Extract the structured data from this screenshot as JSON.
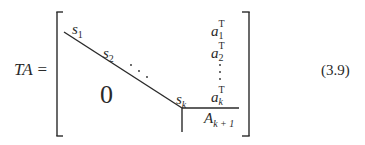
{
  "equation": {
    "lhs": {
      "text": "TA",
      "operator": "="
    },
    "number": "(3.9)",
    "matrix": {
      "diagonal": [
        {
          "base": "s",
          "sub": "1"
        },
        {
          "base": "s",
          "sub": "2"
        },
        {
          "ellipsis": "⋱"
        },
        {
          "base": "s",
          "sub": "k"
        }
      ],
      "lower_block": "0",
      "right_column": [
        {
          "base": "a",
          "sub": "1",
          "sup": "T"
        },
        {
          "base": "a",
          "sub": "2",
          "sup": "T"
        },
        {
          "ellipsis": "⋮"
        },
        {
          "base": "a",
          "sub": "k",
          "sup": "T"
        }
      ],
      "bottom_right_block": {
        "base": "A",
        "sub": "k + 1"
      }
    }
  },
  "colors": {
    "ink": "#2a2a2a",
    "background": "#ffffff"
  }
}
